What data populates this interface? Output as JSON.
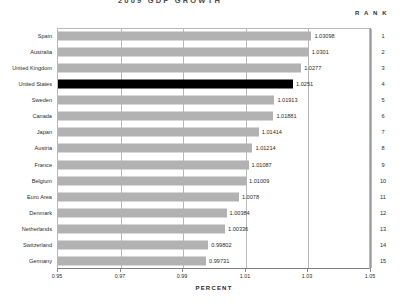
{
  "header": {
    "title": "2009  GDP  GROWTH",
    "rank_header": "R A N K"
  },
  "axis": {
    "x_title": "PERCENT",
    "ticks": [
      "0.95",
      "0.97",
      "0.99",
      "1.01",
      "1.03",
      "1.05"
    ]
  },
  "colors": {
    "bar": "#b2b2b2",
    "highlight_bar": "#000000",
    "grid": "#b9b9b9",
    "text": "#2b2b2b"
  },
  "chart_data": {
    "type": "bar",
    "orientation": "horizontal",
    "title": "2009  GDP  GROWTH",
    "xlabel": "PERCENT",
    "ylabel": "",
    "xlim": [
      0.95,
      1.05
    ],
    "xticks": [
      0.95,
      0.97,
      0.99,
      1.01,
      1.03,
      1.05
    ],
    "grid": true,
    "legend": "none",
    "highlight_category": "United States",
    "categories": [
      "Spain",
      "Australia",
      "United Kingdom",
      "United States",
      "Sweden",
      "Canada",
      "Japan",
      "Austria",
      "France",
      "Belgium",
      "Euro Area",
      "Denmark",
      "Netherlands",
      "Switzerland",
      "Germany"
    ],
    "values": [
      1.03098,
      1.0301,
      1.0277,
      1.0251,
      1.01913,
      1.01881,
      1.01414,
      1.01214,
      1.01087,
      1.01009,
      1.0078,
      1.00384,
      1.00336,
      0.99802,
      0.99731
    ],
    "value_labels": [
      "1.03098",
      "1.0301",
      "1.0277",
      "1.0251",
      "1.01913",
      "1.01881",
      "1.01414",
      "1.01214",
      "1.01087",
      "1.01009",
      "1.0078",
      "1.00384",
      "1.00336",
      "0.99802",
      "0.99731"
    ],
    "ranks": [
      1,
      2,
      3,
      4,
      5,
      6,
      7,
      8,
      9,
      10,
      11,
      12,
      13,
      14,
      15
    ]
  }
}
